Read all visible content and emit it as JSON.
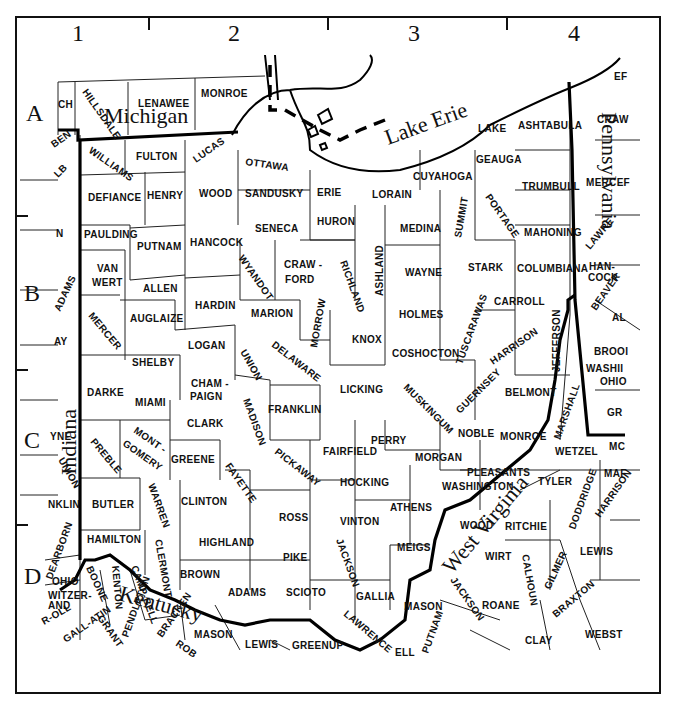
{
  "map": {
    "title_partial": "Ohio",
    "grid": {
      "columns": [
        "1",
        "2",
        "3",
        "4"
      ],
      "rows": [
        "A",
        "B",
        "C",
        "D"
      ]
    },
    "states": [
      "Michigan",
      "Indiana",
      "Pennsylvania",
      "West Virginia",
      "Kentucky"
    ],
    "water": [
      "Lake Erie"
    ],
    "ohio_counties": [
      "Williams",
      "Fulton",
      "Lucas",
      "Ottawa",
      "Defiance",
      "Henry",
      "Wood",
      "Sandusky",
      "Erie",
      "Lorain",
      "Cuyahoga",
      "Lake",
      "Geauga",
      "Ashtabula",
      "Trumbull",
      "Portage",
      "Summit",
      "Medina",
      "Huron",
      "Seneca",
      "Hancock",
      "Putnam",
      "Paulding",
      "Van Wert",
      "Allen",
      "Hardin",
      "Wyandot",
      "Craw-ford",
      "Richland",
      "Ashland",
      "Wayne",
      "Stark",
      "Columbiana",
      "Mahoning",
      "Carroll",
      "Holmes",
      "Knox",
      "Morrow",
      "Marion",
      "Auglaize",
      "Mercer",
      "Shelby",
      "Logan",
      "Union",
      "Delaware",
      "Licking",
      "Coshocton",
      "Tuscarawas",
      "Harrison",
      "Jefferson",
      "Darke",
      "Miami",
      "Cham-paign",
      "Clark",
      "Madison",
      "Franklin",
      "Muskingum",
      "Guernsey",
      "Belmont",
      "Noble",
      "Monroe",
      "Preble",
      "Mont-gomery",
      "Greene",
      "Fayette",
      "Pickaway",
      "Fairfield",
      "Perry",
      "Morgan",
      "Washington",
      "Butler",
      "Warren",
      "Clinton",
      "Hocking",
      "Athens",
      "Ross",
      "Vinton",
      "Meigs",
      "Hamilton",
      "Clermont",
      "Highland",
      "Pike",
      "Jackson",
      "Brown",
      "Adams",
      "Scioto",
      "Gallia",
      "Lawrence"
    ],
    "michigan_counties": [
      "Hillsdale",
      "Lenawee",
      "Monroe"
    ],
    "indiana_counties": [
      "Steuben",
      "DeKalb",
      "Allen",
      "Adams",
      "Jay",
      "Randolph",
      "Wayne",
      "Union",
      "Franklin",
      "Dearborn",
      "Ohio",
      "Switzerland"
    ],
    "pennsylvania_counties": [
      "Erie",
      "Crawford",
      "Mercer",
      "Lawrence",
      "Beaver",
      "Allegheny",
      "Washington",
      "Greene"
    ],
    "west_virginia_counties": [
      "Hancock",
      "Brooke",
      "Ohio",
      "Marshall",
      "Wetzel",
      "Monongalia",
      "Marion",
      "Tyler",
      "Pleasants",
      "Wood",
      "Ritchie",
      "Doddridge",
      "Harrison",
      "Wirt",
      "Calhoun",
      "Gilmer",
      "Lewis",
      "Jackson",
      "Roane",
      "Braxton",
      "Mason",
      "Putnam",
      "Clay",
      "Webster",
      "Cabell"
    ],
    "kentucky_counties": [
      "Boone",
      "Kenton",
      "Campbell",
      "Grant",
      "Pendleton",
      "Bracken",
      "Robertson",
      "Mason",
      "Lewis",
      "Greenup",
      "Gallatin",
      "Carroll"
    ],
    "labels": {
      "c1": "1",
      "c2": "2",
      "c3": "3",
      "c4": "4",
      "rA": "A",
      "rB": "B",
      "rC": "C",
      "rD": "D",
      "michigan": "Michigan",
      "indiana": "Indiana",
      "pennsylvania": "Pennsylvania",
      "west_virginia": "West Virginia",
      "kentucky": "Kentucky",
      "lake_erie": "Lake Erie",
      "hillsdale": "HILLSDALE",
      "lenawee": "LENAWEE",
      "monroe_mi": "MONROE",
      "mi_ch": "CH",
      "steuben": "BEN",
      "dekalb": "LB",
      "williams": "WILLIAMS",
      "fulton": "FULTON",
      "lucas": "LUCAS",
      "ottawa": "OTTAWA",
      "defiance": "DEFIANCE",
      "henry": "HENRY",
      "wood": "WOOD",
      "sandusky": "SANDUSKY",
      "erie": "ERIE",
      "lorain": "LORAIN",
      "cuyahoga": "CUYAHOGA",
      "lake": "LAKE",
      "geauga": "GEAUGA",
      "ashtabula": "ASHTABULA",
      "trumbull": "TRUMBULL",
      "portage": "PORTAGE",
      "summit": "SUMMIT",
      "medina": "MEDINA",
      "huron": "HURON",
      "seneca": "SENECA",
      "hancock": "HANCOCK",
      "putnam": "PUTNAM",
      "paulding": "PAULDING",
      "van": "VAN",
      "wert": "WERT",
      "allen": "ALLEN",
      "hardin": "HARDIN",
      "wyandot": "WYANDOT",
      "craw": "CRAW -",
      "ford": "FORD",
      "richland": "RICHLAND",
      "ashland": "ASHLAND",
      "wayne": "WAYNE",
      "stark": "STARK",
      "columbiana": "COLUMBIANA",
      "mahoning": "MAHONING",
      "carroll": "CARROLL",
      "holmes": "HOLMES",
      "knox": "KNOX",
      "morrow": "MORROW",
      "marion": "MARION",
      "auglaize": "AUGLAIZE",
      "mercer": "MERCER",
      "shelby": "SHELBY",
      "logan": "LOGAN",
      "union": "UNION",
      "delaware": "DELAWARE",
      "licking": "LICKING",
      "coshocton": "COSHOCTON",
      "tuscarawas": "TUSCARAWAS",
      "harrison": "HARRISON",
      "jefferson": "JEFFERSON",
      "darke": "DARKE",
      "miami": "MIAMI",
      "cham": "CHAM -",
      "paign": "PAIGN",
      "clark": "CLARK",
      "madison": "MADISON",
      "franklin": "FRANKLIN",
      "muskingum": "MUSKINGUM",
      "guernsey": "GUERNSEY",
      "belmont": "BELMONT",
      "noble": "NOBLE",
      "monroe": "MONROE",
      "preble": "PREBLE",
      "mont": "MONT -",
      "gomery": "GOMERY",
      "greene": "GREENE",
      "fayette": "FAYETTE",
      "pickaway": "PICKAWAY",
      "fairfield": "FAIRFIELD",
      "perry": "PERRY",
      "morgan": "MORGAN",
      "washington": "WASHINGTON",
      "butler": "BUTLER",
      "warren": "WARREN",
      "clinton": "CLINTON",
      "hocking": "HOCKING",
      "athens": "ATHENS",
      "ross": "ROSS",
      "vinton": "VINTON",
      "meigs": "MEIGS",
      "hamilton": "HAMILTON",
      "clermont": "CLERMONT",
      "highland": "HIGHLAND",
      "pike": "PIKE",
      "jackson": "JACKSON",
      "brown": "BROWN",
      "adams": "ADAMS",
      "scioto": "SCIOTO",
      "gallia": "GALLIA",
      "lawrence": "LAWRENCE",
      "in_n": "N",
      "in_adams": "ADAMS",
      "in_jay": "AY",
      "in_wayne": "YNE",
      "in_union": "UNION",
      "in_franklin": "NKLIN",
      "dearborn": "DEARBORN",
      "in_ohio": "OHIO",
      "switzer": "WITZER-",
      "land": "AND",
      "pa_erie": "EF",
      "pa_craw": "CRAW",
      "pa_mercer": "MERCEF",
      "pa_lawrence": "LAWRE",
      "wv_hancock1": "HAN-",
      "wv_hancock2": "COCK",
      "beaver": "BEAVER",
      "pa_al": "AL",
      "brooke": "BROOI",
      "wv_washington": "WASHII",
      "wv_ohio": "OHIO",
      "pa_greene": "GR",
      "marshall": "MARSHALL",
      "wetzel": "WETZEL",
      "mono": "MC",
      "wv_marion": "MAF",
      "pleasants": "PLEASANTS",
      "tyler": "TYLER",
      "doddridge": "DODDRIDGE",
      "wv_harrison": "HARRISON",
      "wv_wood": "WOOD",
      "ritchie": "RITCHIE",
      "wirt": "WIRT",
      "calhoun": "CALHOUN",
      "gilmer": "GILMER",
      "wv_lewis": "LEWIS",
      "wv_jackson": "JACKSON",
      "roane": "ROANE",
      "braxton": "BRAXTON",
      "wv_mason": "MASON",
      "wv_putnam": "PUTNAM",
      "clay": "CLAY",
      "webster": "WEBST",
      "cabell": "ELL",
      "boone": "BOONE",
      "kenton": "KENTON",
      "campbell": "CAMP-BELL",
      "grant": "GRANT",
      "pendleton": "PENDLETON",
      "bracken": "BRACKEN",
      "robertson": "ROB",
      "ky_mason": "MASON",
      "ky_lewis": "LEWIS",
      "greenup": "GREENUP",
      "gallatin": "GALL-ATIN",
      "ky_carroll": "R-OLL"
    }
  }
}
